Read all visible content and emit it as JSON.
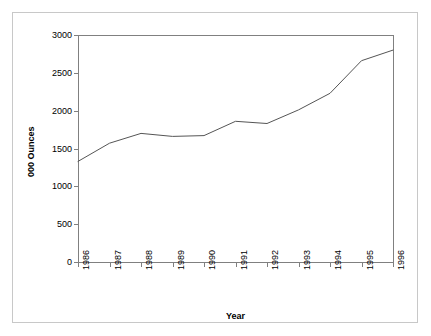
{
  "chart_data": {
    "type": "line",
    "title": "",
    "subtitle": "",
    "xlabel": "Year",
    "ylabel": "000 Ounces",
    "categories": [
      "1986",
      "1987",
      "1988",
      "1989",
      "1990",
      "1991",
      "1992",
      "1993",
      "1994",
      "1995",
      "1996"
    ],
    "x": [
      1986,
      1987,
      1988,
      1989,
      1990,
      1991,
      1992,
      1993,
      1994,
      1995,
      1996
    ],
    "series": [
      {
        "name": "Production",
        "values": [
          1330,
          1570,
          1700,
          1660,
          1670,
          1860,
          1830,
          2010,
          2230,
          2660,
          2800
        ]
      }
    ],
    "ylim": [
      0,
      3000
    ],
    "yticks": [
      0,
      500,
      1000,
      1500,
      2000,
      2500,
      3000
    ],
    "ytick_labels": [
      "0",
      "500",
      "1000",
      "1500",
      "2000",
      "2500",
      "3000"
    ],
    "xtick_labels": [
      "1986",
      "1987",
      "1988",
      "1989",
      "1990",
      "1991",
      "1992",
      "1993",
      "1994",
      "1995",
      "1996"
    ],
    "grid": false,
    "legend": false,
    "legend_position": "none",
    "line_color": "#555555",
    "axis_color": "#808080",
    "frame_color": "#c8c8c8",
    "background_color": "#ffffff"
  }
}
